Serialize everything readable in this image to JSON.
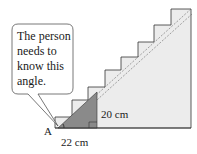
{
  "callout": {
    "lines": [
      "The person",
      "needs to",
      "know this",
      "angle."
    ]
  },
  "labels": {
    "vertex": "A",
    "run": "22 cm",
    "rise": "20 cm"
  },
  "colors": {
    "stair_fill": "#ececec",
    "triangle_fill": "#8a8a8a",
    "outline": "#333333"
  }
}
